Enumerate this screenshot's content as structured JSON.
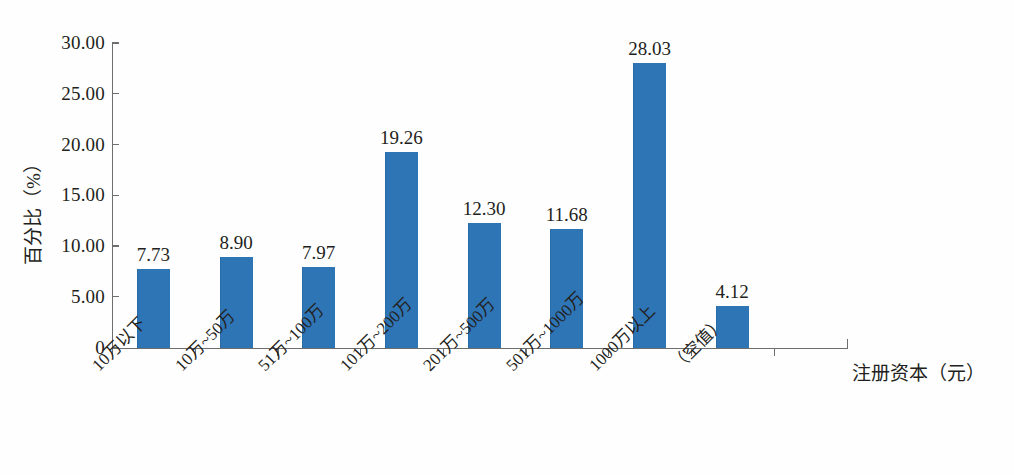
{
  "chart_data": {
    "type": "bar",
    "title": "",
    "subtitle": "",
    "xlabel": "注册资本（元）",
    "ylabel": "百分比（%）",
    "categories": [
      "10万以下",
      "10万~50万",
      "51万~100万",
      "101万~200万",
      "201万~500万",
      "501万~1000万",
      "1000万以上",
      "（空值）"
    ],
    "values": [
      7.73,
      8.9,
      7.97,
      19.26,
      12.3,
      11.68,
      28.03,
      4.12
    ],
    "value_labels": [
      "7.73",
      "8.90",
      "7.97",
      "19.26",
      "12.30",
      "11.68",
      "28.03",
      "4.12"
    ],
    "ylim": [
      0,
      30
    ],
    "ytick_values": [
      0,
      5,
      10,
      15,
      20,
      25,
      30
    ],
    "ytick_labels": [
      "0",
      "5.00",
      "10.00",
      "15.00",
      "20.00",
      "25.00",
      "30.00"
    ],
    "grid": false,
    "legend": false,
    "legend_position": "none",
    "bar_color": "#2e75b6",
    "axis_color": "#6e6e6e",
    "text_color": "#231f20",
    "background_color": "#ffffff",
    "xtick_label_rotation": -45
  }
}
